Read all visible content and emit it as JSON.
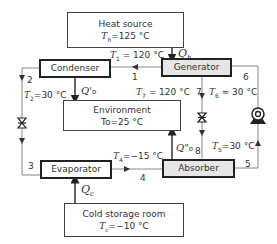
{
  "boxes": {
    "heat_source": {
      "title": "Heat source",
      "temp_sym": "T",
      "temp_sub": "h",
      "temp_val": "=125 °C"
    },
    "condenser": {
      "title": "Condenser"
    },
    "generator": {
      "title": "Generator"
    },
    "environment": {
      "title": "Environment",
      "temp_sym": "T",
      "temp_sub": "o",
      "temp_val": "=25 °C"
    },
    "evaporator": {
      "title": "Evaporator"
    },
    "absorber": {
      "title": "Absorber"
    },
    "cold_storage": {
      "title": "Cold storage room",
      "temp_sym": "T",
      "temp_sub": "c",
      "temp_val": "=−10 °C"
    }
  },
  "labels": {
    "T1": {
      "sym": "T",
      "sub": "1",
      "val": " = 120 °C"
    },
    "T2": {
      "sym": "T",
      "sub": "2",
      "val": "=30 °C"
    },
    "T4": {
      "sym": "T",
      "sub": "4",
      "val": "=−15 °C"
    },
    "T5": {
      "sym": "T",
      "sub": "5",
      "val": "=30 °C"
    },
    "T6": {
      "sym": "T",
      "sub": "6",
      "val": " ≈ 30 °C"
    },
    "T7": {
      "sym": "T",
      "sub": "7",
      "val": " = 120 °C"
    },
    "Qh": {
      "sym": "Q",
      "sub": "h"
    },
    "Qc": {
      "sym": "Q",
      "sub": "c"
    },
    "Q0p": {
      "sym": "Q'",
      "sub": "o"
    },
    "Q0pp": {
      "sym": "Q\"",
      "sub": "o"
    },
    "state_numbers": [
      "1",
      "2",
      "3",
      "4",
      "5",
      "6",
      "7",
      "8"
    ]
  }
}
